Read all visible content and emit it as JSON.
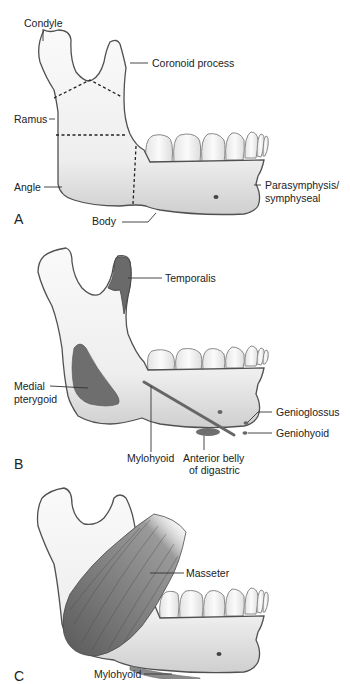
{
  "figure": {
    "panels": [
      {
        "id": "A",
        "letter": "A",
        "labels": {
          "condyle": "Condyle",
          "coronoid": "Coronoid process",
          "ramus": "Ramus",
          "angle": "Angle",
          "body": "Body",
          "parasymphysis_1": "Parasymphysis/",
          "parasymphysis_2": "symphyseal"
        }
      },
      {
        "id": "B",
        "letter": "B",
        "labels": {
          "temporalis": "Temporalis",
          "medial_pterygoid_1": "Medial",
          "medial_pterygoid_2": "pterygoid",
          "genioglossus": "Genioglossus",
          "geniohyoid": "Geniohyoid",
          "mylohyoid": "Mylohyoid",
          "anterior_belly_1": "Anterior belly",
          "anterior_belly_2": "of digastric"
        }
      },
      {
        "id": "C",
        "letter": "C",
        "labels": {
          "masseter": "Masseter",
          "mylohyoid": "Mylohyoid"
        }
      }
    ],
    "colors": {
      "bone_fill": "#f2f2f2",
      "bone_shade": "#d6d6d6",
      "outline": "#555555",
      "muscle": "#6e6e6e",
      "leader": "#333333"
    }
  }
}
